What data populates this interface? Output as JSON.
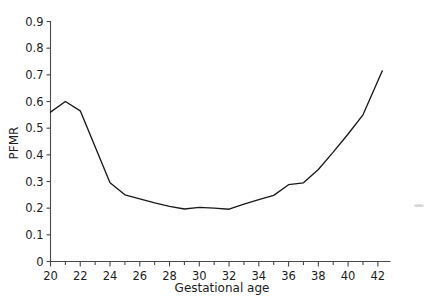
{
  "chart_data": {
    "type": "line",
    "title": "",
    "xlabel": "Gestational age",
    "ylabel": "PFMR",
    "xlim": [
      19.6,
      42.6
    ],
    "ylim": [
      0,
      0.9
    ],
    "grid": false,
    "legend": "none",
    "x_major_ticks": [
      20,
      22,
      24,
      26,
      28,
      30,
      32,
      34,
      36,
      38,
      40,
      42
    ],
    "x_major_tick_labels": [
      "20",
      "22",
      "24",
      "26",
      "28",
      "30",
      "32",
      "34",
      "36",
      "38",
      "40",
      "42"
    ],
    "x_minor_ticks": [
      21,
      23,
      25,
      27,
      29,
      31,
      33,
      35,
      37,
      39,
      41
    ],
    "y_ticks": [
      0,
      0.1,
      0.2,
      0.3,
      0.4,
      0.5,
      0.6,
      0.7,
      0.8,
      0.9
    ],
    "y_tick_labels": [
      "0",
      "0.1",
      "0.2",
      "0.3",
      "0.4",
      "0.5",
      "0.6",
      "0.7",
      "0.8",
      "0.9"
    ],
    "line_color": "#1a1a1a",
    "axis_color": "#4a4a4a",
    "x": [
      20,
      21,
      22,
      23,
      24,
      25,
      26,
      27,
      28,
      29,
      30,
      31,
      32,
      33,
      34,
      35,
      36,
      37,
      38,
      39,
      40,
      41,
      42.3
    ],
    "values": [
      0.56,
      0.6,
      0.565,
      0.43,
      0.295,
      0.25,
      0.235,
      0.22,
      0.207,
      0.197,
      0.203,
      0.2,
      0.196,
      0.215,
      0.232,
      0.248,
      0.288,
      0.295,
      0.345,
      0.41,
      0.478,
      0.55,
      0.715
    ],
    "series": [
      {
        "name": "PFMR",
        "values": [
          0.56,
          0.6,
          0.565,
          0.43,
          0.295,
          0.25,
          0.235,
          0.22,
          0.207,
          0.197,
          0.203,
          0.2,
          0.196,
          0.215,
          0.232,
          0.248,
          0.288,
          0.295,
          0.345,
          0.41,
          0.478,
          0.55,
          0.715
        ]
      }
    ]
  }
}
